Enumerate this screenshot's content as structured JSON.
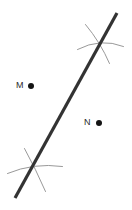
{
  "figure": {
    "kind": "geometric-construction",
    "width": 132,
    "height": 210,
    "background_color": "#ffffff",
    "bisector_line": {
      "label": "perpendicular-bisector",
      "color": "#333333",
      "stroke_width": 3.2,
      "x1": 117,
      "y1": 13,
      "x2": 15,
      "y2": 198
    },
    "arcs": [
      {
        "name": "top-arc-steep",
        "color": "#8d8d8d",
        "stroke_width": 0.9,
        "path": "M 85.5 24.5 Q 100.5 42.5 109.5 63.5"
      },
      {
        "name": "top-arc-flat",
        "color": "#8d8d8d",
        "stroke_width": 0.9,
        "path": "M 77.5 49.5 Q 100.5 37.5 123.5 46.5"
      },
      {
        "name": "bottom-arc-steep",
        "color": "#8d8d8d",
        "stroke_width": 0.9,
        "path": "M 24.5 148.5 Q 35.5 168.5 45.5 191.5"
      },
      {
        "name": "bottom-arc-flat",
        "color": "#8d8d8d",
        "stroke_width": 0.9,
        "path": "M 7.5 173.5 Q 33.5 162.5 62.5 166.5"
      }
    ],
    "intersections": [
      {
        "name": "top-arc-intersection",
        "x": 96,
        "y": 44
      },
      {
        "name": "bottom-arc-intersection",
        "x": 36,
        "y": 170
      }
    ],
    "points": [
      {
        "id": "point-m",
        "label": "M",
        "label_x": 16,
        "label_y": 81,
        "dot_x": 31,
        "dot_y": 86,
        "dot_radius": 3.2,
        "dot_color": "#141414"
      },
      {
        "id": "point-n",
        "label": "N",
        "label_x": 84,
        "label_y": 118,
        "dot_x": 99,
        "dot_y": 123,
        "dot_radius": 3.2,
        "dot_color": "#141414"
      }
    ]
  }
}
